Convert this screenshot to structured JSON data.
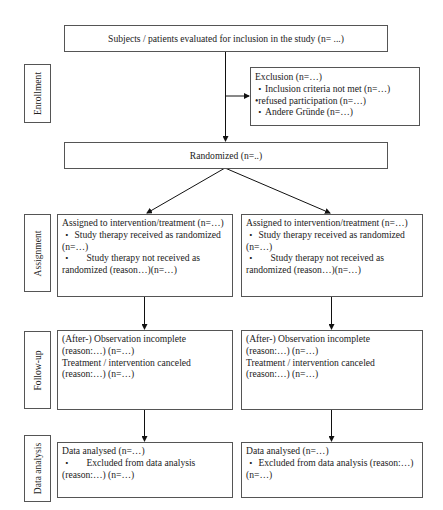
{
  "phases": {
    "enrollment": "Enrollment",
    "assignment": "Assignment",
    "followup": "Follow-up",
    "analysis": "Data analysis"
  },
  "screening": {
    "text": "Subjects / patients evaluated for inclusion in the study (n= ...)"
  },
  "exclusion": {
    "title": "Exclusion (n=…)",
    "items": [
      "・Inclusion criteria not met (n=…)",
      "•refused participation (n=…)",
      "・Andere Gründe (n=…)"
    ]
  },
  "randomized": {
    "text": "Randomized (n=..)"
  },
  "arms": [
    {
      "assignment": {
        "title": "Assigned to intervention/treatment (n=…)",
        "received_line1": "・ Study therapy received as randomized",
        "received_line2": "(n=…)",
        "not_received_line1": "・      Study therapy not received as",
        "not_received_line2": "randomized (reason…)(n=…)"
      },
      "followup": {
        "line1": "(After-) Observation incomplete",
        "line2": "(reason:…) (n=…)",
        "line3": "Treatment / intervention canceled",
        "line4": "(reason:…) (n=…)"
      },
      "analysis": {
        "line1": "Data analysed (n=…)",
        "line2": "・      Excluded from data analysis",
        "line3": "(reason:…) (n=…)"
      }
    },
    {
      "assignment": {
        "title": "Assigned to intervention/treatment (n=…)",
        "received_line1": "・ Study therapy received as randomized",
        "received_line2": "(n=…)",
        "not_received_line1": "・      Study therapy not received as",
        "not_received_line2": "randomized (reason…)(n=…)"
      },
      "followup": {
        "line1": "(After-) Observation incomplete",
        "line2": "(reason:…) (n=…)",
        "line3": "Treatment / intervention canceled",
        "line4": "(reason:…) (n=…)"
      },
      "analysis": {
        "line1": "Data analysed (n=…)",
        "line2": "・ Excluded from data analysis (reason:…)",
        "line3": "(n=…)"
      }
    }
  ]
}
